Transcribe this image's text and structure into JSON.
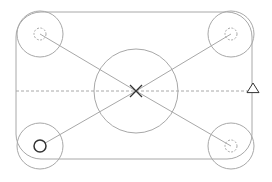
{
  "diagram": {
    "type": "mechanical-sketch",
    "width": 272,
    "height": 182,
    "colors": {
      "background": "#ffffff",
      "line": "#a8a8a8",
      "dark": "#333333"
    },
    "outline": {
      "x": 16,
      "y": 12,
      "w": 236,
      "h": 147,
      "r": 25
    },
    "center_circle": {
      "cx": 136,
      "cy": 91,
      "r": 42
    },
    "center_mark": {
      "x": 136,
      "y": 91,
      "size": 6
    },
    "centerline": {
      "y": 91,
      "x1": 16,
      "x2": 252
    },
    "corner_bosses": [
      {
        "id": "top-left",
        "cx": 40,
        "cy": 34,
        "r": 23,
        "hole_r": 6,
        "hole_style": "dashed"
      },
      {
        "id": "top-right",
        "cx": 231,
        "cy": 34,
        "r": 23,
        "hole_r": 6,
        "hole_style": "dashed"
      },
      {
        "id": "bottom-left",
        "cx": 40,
        "cy": 146,
        "r": 23,
        "hole_r": 6,
        "hole_style": "solid-dark"
      },
      {
        "id": "bottom-right",
        "cx": 231,
        "cy": 146,
        "r": 23,
        "hole_r": 6,
        "hole_style": "dashed"
      }
    ],
    "triangle_marker": {
      "x": 253,
      "y": 89,
      "size": 6
    }
  }
}
